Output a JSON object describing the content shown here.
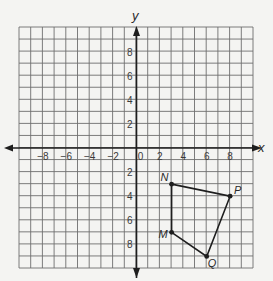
{
  "figure": {
    "x_axis_label": "x",
    "y_axis_label": "y",
    "x_tick_labels": [
      "−8",
      "−6",
      "−4",
      "−2",
      "0",
      "2",
      "4",
      "6",
      "8"
    ],
    "y_tick_labels": [
      "8",
      "6",
      "4",
      "2",
      "2",
      "4",
      "6",
      "8"
    ],
    "colors": {
      "grid": "#6e6e6e",
      "axis": "#1e1e1e",
      "shape": "#1e1e1e",
      "background": "#f4f4f2"
    }
  },
  "chart_data": {
    "type": "scatter",
    "title": "",
    "xlabel": "x",
    "ylabel": "y",
    "xlim": [
      -10,
      10
    ],
    "ylim": [
      -10,
      10
    ],
    "grid": true,
    "x_ticks": [
      -8,
      -6,
      -4,
      -2,
      0,
      2,
      4,
      6,
      8
    ],
    "y_ticks": [
      8,
      6,
      4,
      2,
      -2,
      -4,
      -6,
      -8
    ],
    "polygon": {
      "name": "NPQM",
      "vertices": [
        {
          "label": "N",
          "x": 3,
          "y": -3
        },
        {
          "label": "P",
          "x": 8,
          "y": -4
        },
        {
          "label": "Q",
          "x": 6,
          "y": -9
        },
        {
          "label": "M",
          "x": 3,
          "y": -7
        }
      ]
    }
  }
}
